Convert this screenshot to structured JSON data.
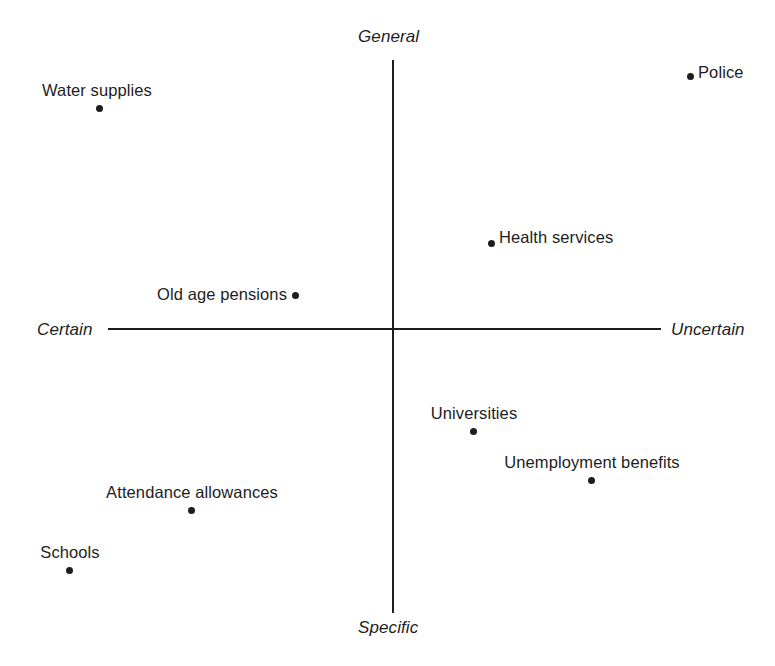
{
  "chart_data": {
    "type": "scatter",
    "title": "",
    "subtitle": "",
    "xlabel": "",
    "ylabel": "",
    "grid": false,
    "legend": null,
    "axis_labels": {
      "left": "Certain",
      "right": "Uncertain",
      "top": "General",
      "bottom": "Specific"
    },
    "axes": {
      "origin_x": 393,
      "origin_y": 329,
      "horizontal_start_x": 108,
      "horizontal_end_x": 661,
      "vertical_start_y": 60,
      "vertical_end_y": 613,
      "xlim": [
        108,
        661
      ],
      "ylim": [
        60,
        613
      ]
    },
    "points": [
      {
        "label": "Water supplies",
        "x": 99,
        "y": 108,
        "quadrant": "certain-general",
        "label_position": "above",
        "label_x": 97,
        "label_y": 100
      },
      {
        "label": "Police",
        "x": 690,
        "y": 76,
        "quadrant": "uncertain-general",
        "label_position": "right",
        "label_x": 698,
        "label_y": 72
      },
      {
        "label": "Health services",
        "x": 491,
        "y": 243,
        "quadrant": "uncertain-general",
        "label_position": "right",
        "label_x": 499,
        "label_y": 237
      },
      {
        "label": "Old age pensions",
        "x": 295,
        "y": 295,
        "quadrant": "certain-general",
        "label_position": "left",
        "label_x": 287,
        "label_y": 294
      },
      {
        "label": "Universities",
        "x": 473,
        "y": 431,
        "quadrant": "uncertain-specific",
        "label_position": "above",
        "label_x": 474,
        "label_y": 423
      },
      {
        "label": "Unemployment benefits",
        "x": 591,
        "y": 480,
        "quadrant": "uncertain-specific",
        "label_position": "above",
        "label_x": 592,
        "label_y": 472
      },
      {
        "label": "Attendance allowances",
        "x": 191,
        "y": 510,
        "quadrant": "certain-specific",
        "label_position": "above",
        "label_x": 192,
        "label_y": 502
      },
      {
        "label": "Schools",
        "x": 69,
        "y": 570,
        "quadrant": "certain-specific",
        "label_position": "above",
        "label_x": 70,
        "label_y": 562
      }
    ],
    "colors": {
      "point": "#1d1d1d",
      "axis": "#1d1d1d",
      "text": "#1d1d1d",
      "background": "#ffffff"
    }
  }
}
